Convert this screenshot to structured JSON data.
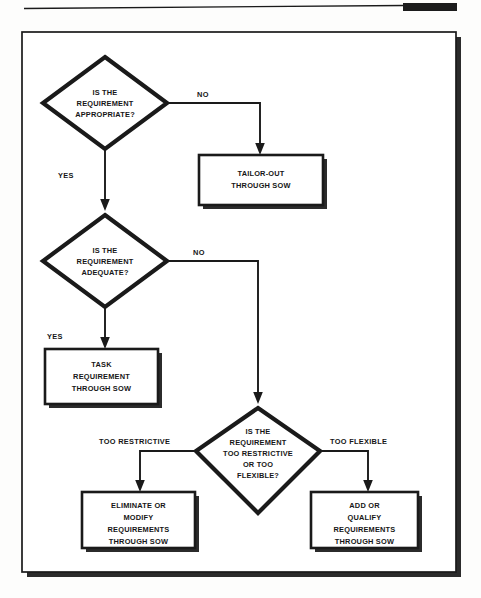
{
  "document": {
    "type": "flowchart",
    "title": "Requirement Tailoring Decision Flowchart",
    "header_rule": {
      "thin_rule_color": "#1a1a1a",
      "thick_block_color": "#1c1c1c"
    },
    "frame": {
      "border_color": "#1a1a1a",
      "shadow_color": "#2b2b2b",
      "background": "#ffffff"
    }
  },
  "nodes": {
    "decision_1": {
      "id": "decision-is-requirement-appropriate",
      "shape": "diamond",
      "lines": [
        "IS THE",
        "REQUIREMENT",
        "APPROPRIATE?"
      ]
    },
    "process_tailor_out": {
      "id": "process-tailor-out-through-sow",
      "shape": "rectangle",
      "lines": [
        "TAILOR-OUT",
        "THROUGH SOW"
      ]
    },
    "decision_2": {
      "id": "decision-is-requirement-adequate",
      "shape": "diamond",
      "lines": [
        "IS THE",
        "REQUIREMENT",
        "ADEQUATE?"
      ]
    },
    "process_task_requirement": {
      "id": "process-task-requirement-through-sow",
      "shape": "rectangle",
      "lines": [
        "TASK",
        "REQUIREMENT",
        "THROUGH SOW"
      ]
    },
    "decision_3": {
      "id": "decision-too-restrictive-or-too-flexible",
      "shape": "diamond",
      "lines": [
        "IS THE",
        "REQUIREMENT",
        "TOO RESTRICTIVE",
        "OR TOO",
        "FLEXIBLE?"
      ]
    },
    "process_eliminate_modify": {
      "id": "process-eliminate-or-modify-requirements",
      "shape": "rectangle",
      "lines": [
        "ELIMINATE OR",
        "MODIFY",
        "REQUIREMENTS",
        "THROUGH SOW"
      ]
    },
    "process_add_qualify": {
      "id": "process-add-or-qualify-requirements",
      "shape": "rectangle",
      "lines": [
        "ADD OR",
        "QUALIFY",
        "REQUIREMENTS",
        "THROUGH SOW"
      ]
    }
  },
  "edge_labels": {
    "no_1": "NO",
    "yes_1": "YES",
    "no_2": "NO",
    "yes_2": "YES",
    "too_restrictive": "TOO RESTRICTIVE",
    "too_flexible": "TOO FLEXIBLE"
  },
  "edges": [
    {
      "from": "decision_1",
      "to": "process_tailor_out",
      "label": "NO"
    },
    {
      "from": "decision_1",
      "to": "decision_2",
      "label": "YES"
    },
    {
      "from": "decision_2",
      "to": "decision_3",
      "label": "NO"
    },
    {
      "from": "decision_2",
      "to": "process_task_requirement",
      "label": "YES"
    },
    {
      "from": "decision_3",
      "to": "process_eliminate_modify",
      "label": "TOO RESTRICTIVE"
    },
    {
      "from": "decision_3",
      "to": "process_add_qualify",
      "label": "TOO FLEXIBLE"
    }
  ]
}
